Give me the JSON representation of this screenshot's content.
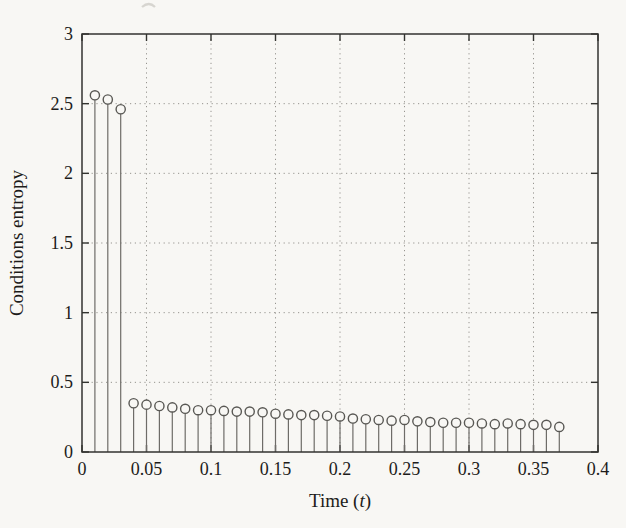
{
  "figure": {
    "kind": "scanned journal stem plot"
  },
  "colors": {
    "background": "#f8f7f4",
    "axis": "#333330",
    "stem": "#6e6c68",
    "marker": "#595854",
    "grid": "#96948f",
    "text": "#1d1c1a"
  },
  "chart_data": {
    "type": "stem",
    "title": "",
    "ylabel": "Conditions entropy",
    "xlabel_prefix": "Time (",
    "xlabel_var": "t",
    "xlabel_suffix": ")",
    "xlim": [
      0,
      0.4
    ],
    "ylim": [
      0,
      3
    ],
    "xticks": [
      0,
      0.05,
      0.1,
      0.15,
      0.2,
      0.25,
      0.3,
      0.35,
      0.4
    ],
    "xtick_labels": [
      "0",
      "0.05",
      "0.1",
      "0.15",
      "0.2",
      "0.25",
      "0.3",
      "0.35",
      "0.4"
    ],
    "yticks": [
      0,
      0.5,
      1,
      1.5,
      2,
      2.5,
      3
    ],
    "ytick_labels": [
      "0",
      "0.5",
      "1",
      "1.5",
      "2",
      "2.5",
      "3"
    ],
    "grid": "dotted",
    "legend": "none",
    "marker": "open-circle",
    "x": [
      0.01,
      0.02,
      0.03,
      0.04,
      0.05,
      0.06,
      0.07,
      0.08,
      0.09,
      0.1,
      0.11,
      0.12,
      0.13,
      0.14,
      0.15,
      0.16,
      0.17,
      0.18,
      0.19,
      0.2,
      0.21,
      0.22,
      0.23,
      0.24,
      0.25,
      0.26,
      0.27,
      0.28,
      0.29,
      0.3,
      0.31,
      0.32,
      0.33,
      0.34,
      0.35,
      0.36,
      0.37
    ],
    "y": [
      2.56,
      2.53,
      2.46,
      0.35,
      0.34,
      0.33,
      0.32,
      0.31,
      0.3,
      0.3,
      0.295,
      0.29,
      0.29,
      0.285,
      0.275,
      0.27,
      0.265,
      0.265,
      0.26,
      0.255,
      0.24,
      0.235,
      0.23,
      0.225,
      0.23,
      0.22,
      0.215,
      0.21,
      0.21,
      0.21,
      0.205,
      0.2,
      0.205,
      0.2,
      0.195,
      0.195,
      0.18
    ]
  }
}
